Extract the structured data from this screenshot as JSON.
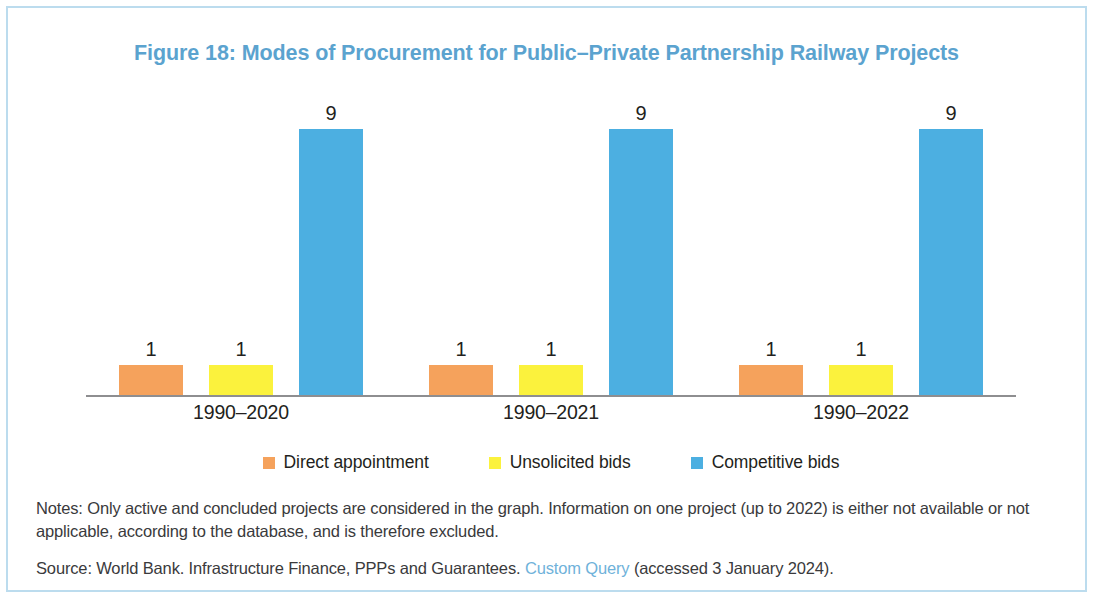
{
  "figure": {
    "title": "Figure 18: Modes of Procurement for Public–Private Partnership Railway Projects",
    "title_color": "#5ba3cf",
    "border_color": "#bcdcee"
  },
  "notes": {
    "text": "Notes: Only active and concluded projects are considered in the graph. Information on one project (up to 2022) is either not available or not applicable, according to the database, and is therefore excluded."
  },
  "source": {
    "prefix": "Source: World Bank. Infrastructure Finance, PPPs and Guarantees. ",
    "link_text": "Custom Query",
    "suffix": " (accessed 3 January 2024).",
    "link_color": "#6fb2da"
  },
  "chart_data": {
    "type": "bar",
    "title": "Figure 18: Modes of Procurement for Public–Private Partnership Railway Projects",
    "xlabel": "",
    "ylabel": "",
    "ylim": [
      0,
      10
    ],
    "grid": false,
    "legend_position": "bottom",
    "categories": [
      "1990–2020",
      "1990–2021",
      "1990–2022"
    ],
    "series": [
      {
        "name": "Direct appointment",
        "color": "#f5a25c",
        "values": [
          1,
          1,
          1
        ]
      },
      {
        "name": "Unsolicited bids",
        "color": "#fbf23d",
        "values": [
          1,
          1,
          1
        ]
      },
      {
        "name": "Competitive bids",
        "color": "#4cafe1",
        "values": [
          9,
          9,
          9
        ]
      }
    ],
    "data_labels": [
      [
        "1",
        "1",
        "9"
      ],
      [
        "1",
        "1",
        "9"
      ],
      [
        "1",
        "1",
        "9"
      ]
    ]
  }
}
